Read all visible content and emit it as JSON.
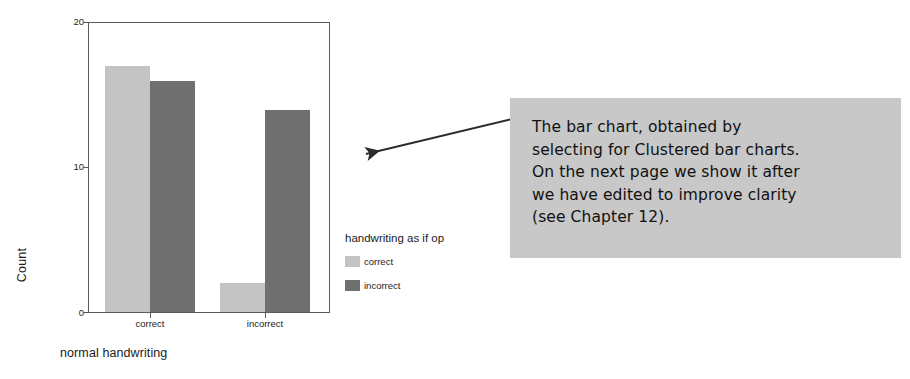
{
  "chart_data": {
    "type": "bar",
    "title": "",
    "xlabel": "normal handwriting",
    "ylabel": "Count",
    "categories": [
      "correct",
      "incorrect"
    ],
    "series": [
      {
        "name": "correct",
        "color": "#c3c3c3",
        "values": [
          17,
          2
        ]
      },
      {
        "name": "incorrect",
        "color": "#6f6f6f",
        "values": [
          16,
          14
        ]
      }
    ],
    "legend_title": "handwriting as if op",
    "legend_position": "right",
    "ylim": [
      0,
      20
    ],
    "yticks": [
      0,
      10,
      20
    ],
    "ytick_labels": [
      "0",
      "10",
      "20"
    ],
    "grid": false,
    "frame": true
  },
  "axes": {
    "y_title": "Count",
    "x_title": "normal handwriting",
    "y_ticks": [
      {
        "label": "20",
        "value": 20
      },
      {
        "label": "10",
        "value": 10
      },
      {
        "label": "0",
        "value": 0
      }
    ],
    "x_ticks": [
      {
        "label": "correct"
      },
      {
        "label": "incorrect"
      }
    ]
  },
  "legend": {
    "title": "handwriting as if op",
    "items": [
      {
        "label": "correct",
        "color": "#c3c3c3"
      },
      {
        "label": "incorrect",
        "color": "#6f6f6f"
      }
    ]
  },
  "callout": {
    "text": "The bar chart, obtained by\nselecting for Clustered bar charts.\nOn the next page we show it after\nwe have edited to improve clarity\n(see Chapter 12).",
    "background": "#c8c8c8"
  },
  "colors": {
    "bar_light": "#c3c3c3",
    "bar_dark": "#6f6f6f",
    "axis": "#5a5a5a",
    "text": "#1a1a1a",
    "callout_bg": "#c8c8c8",
    "arrow": "#2b2b2b"
  }
}
